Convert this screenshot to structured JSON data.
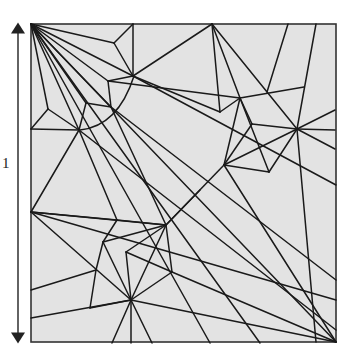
{
  "figure": {
    "type": "origami-crease-pattern",
    "dimension_label": "1",
    "colors": {
      "paper": "#e3e3e3",
      "crease": "#1a1a1a",
      "border": "#333333",
      "arrow": "#222222"
    },
    "square": {
      "x1": 31,
      "y1": 24,
      "x2": 336,
      "y2": 342
    },
    "arrow": {
      "x": 18,
      "y1": 24,
      "y2": 342
    },
    "arc": {
      "path": "M 80 130 Q 118 126 134 76"
    },
    "creases": [
      [
        31,
        24,
        336,
        342
      ],
      [
        31,
        24,
        114,
        43
      ],
      [
        31,
        24,
        133,
        76
      ],
      [
        31,
        24,
        108,
        81
      ],
      [
        31,
        24,
        86,
        103
      ],
      [
        31,
        24,
        111,
        107
      ],
      [
        31,
        24,
        79,
        130
      ],
      [
        31,
        24,
        48,
        109
      ],
      [
        114,
        43,
        133,
        24
      ],
      [
        114,
        43,
        133,
        76
      ],
      [
        133,
        24,
        133,
        76
      ],
      [
        133,
        76,
        212,
        24
      ],
      [
        133,
        76,
        336,
        185
      ],
      [
        133,
        76,
        108,
        81
      ],
      [
        108,
        81,
        111,
        107
      ],
      [
        108,
        81,
        240,
        98
      ],
      [
        86,
        103,
        111,
        107
      ],
      [
        86,
        103,
        79,
        130
      ],
      [
        111,
        107,
        336,
        280
      ],
      [
        111,
        107,
        166,
        225
      ],
      [
        79,
        130,
        48,
        109
      ],
      [
        48,
        109,
        31,
        129
      ],
      [
        31,
        129,
        79,
        130
      ],
      [
        79,
        130,
        31,
        212
      ],
      [
        79,
        130,
        117,
        220
      ],
      [
        79,
        130,
        336,
        330
      ],
      [
        212,
        24,
        220,
        112
      ],
      [
        212,
        24,
        240,
        98
      ],
      [
        212,
        24,
        297,
        129
      ],
      [
        288,
        24,
        267,
        92
      ],
      [
        316,
        24,
        297,
        129
      ],
      [
        240,
        98,
        304,
        87
      ],
      [
        240,
        98,
        220,
        112
      ],
      [
        240,
        98,
        224,
        165
      ],
      [
        240,
        98,
        252,
        124
      ],
      [
        240,
        98,
        269,
        172
      ],
      [
        220,
        112,
        133,
        76
      ],
      [
        252,
        124,
        297,
        129
      ],
      [
        252,
        124,
        224,
        165
      ],
      [
        297,
        129,
        335,
        110
      ],
      [
        297,
        129,
        335,
        130
      ],
      [
        297,
        129,
        335,
        149
      ],
      [
        297,
        129,
        224,
        165
      ],
      [
        297,
        129,
        269,
        172
      ],
      [
        297,
        129,
        316,
        342
      ],
      [
        224,
        165,
        166,
        225
      ],
      [
        224,
        165,
        269,
        172
      ],
      [
        224,
        165,
        336,
        342
      ],
      [
        31,
        212,
        117,
        220
      ],
      [
        31,
        212,
        166,
        225
      ],
      [
        31,
        212,
        131,
        300
      ],
      [
        31,
        212,
        336,
        300
      ],
      [
        117,
        220,
        103,
        242
      ],
      [
        117,
        220,
        166,
        225
      ],
      [
        166,
        225,
        103,
        242
      ],
      [
        166,
        225,
        126,
        252
      ],
      [
        166,
        225,
        131,
        300
      ],
      [
        166,
        225,
        172,
        272
      ],
      [
        166,
        225,
        200,
        190
      ],
      [
        103,
        242,
        96,
        270
      ],
      [
        103,
        242,
        131,
        300
      ],
      [
        126,
        252,
        131,
        300
      ],
      [
        126,
        252,
        172,
        272
      ],
      [
        96,
        270,
        31,
        290
      ],
      [
        96,
        270,
        90,
        308
      ],
      [
        90,
        308,
        131,
        300
      ],
      [
        31,
        318,
        131,
        300
      ],
      [
        131,
        300,
        112,
        343
      ],
      [
        131,
        300,
        131,
        343
      ],
      [
        131,
        300,
        152,
        343
      ],
      [
        131,
        300,
        172,
        272
      ],
      [
        131,
        300,
        336,
        342
      ],
      [
        172,
        272,
        336,
        342
      ],
      [
        31,
        24,
        210,
        343
      ],
      [
        31,
        24,
        260,
        343
      ]
    ]
  }
}
